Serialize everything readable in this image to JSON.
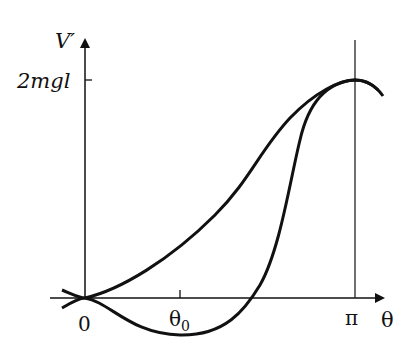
{
  "figure": {
    "type": "potential-energy-diagram",
    "y_axis_label": "V′",
    "x_axis_label": "θ",
    "y_ticks": [
      {
        "label": "2mgl",
        "y": 80
      }
    ],
    "x_ticks": [
      {
        "label": "0",
        "x": 85
      },
      {
        "label": "θ",
        "sub": "0",
        "x": 180
      },
      {
        "label": "π",
        "x": 355
      }
    ],
    "curves": [
      {
        "name": "curve-monotonic",
        "description": "rises from 0 at θ=0 to 2mgl at θ=π"
      },
      {
        "name": "curve-with-minimum",
        "description": "dips below zero with minimum near θ₀, crosses zero, rises steeply to 2mgl at θ=π"
      }
    ],
    "colors": {
      "stroke": "#111111",
      "background": "#ffffff"
    }
  },
  "labels": {
    "y_axis": "V′",
    "y_tick_2mgl": "2mgl",
    "x_origin": "0",
    "x_theta0_main": "θ",
    "x_theta0_sub": "0",
    "x_pi": "π",
    "x_axis": "θ"
  }
}
